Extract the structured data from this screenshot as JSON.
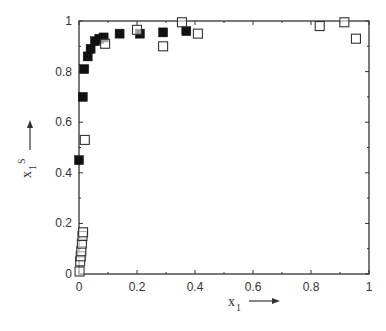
{
  "chart_data": {
    "type": "scatter",
    "title": "",
    "xlabel": "x1",
    "xlabel_arrow": "right",
    "ylabel": "x1^S",
    "ylabel_arrow": "up",
    "xlim": [
      0,
      1
    ],
    "ylim": [
      0,
      1
    ],
    "xticks": [
      0,
      0.2,
      0.4,
      0.6,
      0.8,
      1
    ],
    "xtick_labels": [
      "0",
      "0.2",
      "0.4",
      "0.6",
      "0.8",
      "1"
    ],
    "yticks": [
      0,
      0.2,
      0.4,
      0.6,
      0.8,
      1
    ],
    "ytick_labels": [
      "0",
      "0.2",
      "0.4",
      "0.6",
      "0.8",
      "1"
    ],
    "grid": false,
    "legend": null,
    "series": [
      {
        "name": "filled squares",
        "marker": "square-filled",
        "color": "#111111",
        "points": [
          {
            "x": 0.0,
            "y": 0.45
          },
          {
            "x": 0.013,
            "y": 0.7
          },
          {
            "x": 0.018,
            "y": 0.81
          },
          {
            "x": 0.03,
            "y": 0.86
          },
          {
            "x": 0.04,
            "y": 0.89
          },
          {
            "x": 0.055,
            "y": 0.92
          },
          {
            "x": 0.07,
            "y": 0.93
          },
          {
            "x": 0.085,
            "y": 0.935
          },
          {
            "x": 0.14,
            "y": 0.95
          },
          {
            "x": 0.21,
            "y": 0.95
          },
          {
            "x": 0.29,
            "y": 0.955
          },
          {
            "x": 0.37,
            "y": 0.96
          }
        ]
      },
      {
        "name": "open squares",
        "marker": "square-open",
        "color": "#333333",
        "points": [
          {
            "x": 0.002,
            "y": 0.01
          },
          {
            "x": 0.004,
            "y": 0.05
          },
          {
            "x": 0.006,
            "y": 0.07
          },
          {
            "x": 0.008,
            "y": 0.09
          },
          {
            "x": 0.01,
            "y": 0.12
          },
          {
            "x": 0.012,
            "y": 0.15
          },
          {
            "x": 0.014,
            "y": 0.165
          },
          {
            "x": 0.02,
            "y": 0.53
          },
          {
            "x": 0.09,
            "y": 0.91
          },
          {
            "x": 0.2,
            "y": 0.965
          },
          {
            "x": 0.29,
            "y": 0.9
          },
          {
            "x": 0.355,
            "y": 0.995
          },
          {
            "x": 0.41,
            "y": 0.95
          },
          {
            "x": 0.83,
            "y": 0.98
          },
          {
            "x": 0.915,
            "y": 0.995
          },
          {
            "x": 0.955,
            "y": 0.93
          }
        ]
      }
    ]
  },
  "layout": {
    "plot_left": 79,
    "plot_right": 369,
    "plot_top": 21,
    "plot_bottom": 274,
    "marker_size": 9
  }
}
